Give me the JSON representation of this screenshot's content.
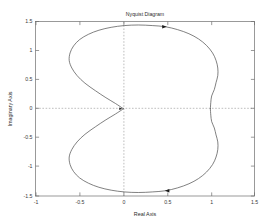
{
  "figure": {
    "title": "Nyquist Diagram",
    "xlabel": "Real Axis",
    "ylabel": "Imaginary Axis",
    "background": "#ffffff",
    "curve_color": "#4a4a4a",
    "grid_color": "#9a9a9a",
    "axis_color": "#6e6e6e"
  },
  "chart_data": {
    "type": "line",
    "title": "Nyquist Diagram",
    "xlabel": "Real Axis",
    "ylabel": "Imaginary Axis",
    "xlim": [
      -1,
      1.5
    ],
    "ylim": [
      -1.5,
      1.5
    ],
    "xticks": [
      -1,
      -0.5,
      0,
      0.5,
      1,
      1.5
    ],
    "xtick_labels": [
      "-1",
      "-0.5",
      "0",
      "0.5",
      "1",
      "1.5"
    ],
    "yticks": [
      -1.5,
      -1,
      -0.5,
      0,
      0.5,
      1,
      1.5
    ],
    "ytick_labels": [
      "-1.5",
      "-1",
      "-0.5",
      "0",
      "0.5",
      "1",
      "1.5"
    ],
    "grid": false,
    "zero_lines": true,
    "legend": null,
    "series": [
      {
        "name": "Nyquist contour (upper branch, increasing frequency)",
        "direction": "clockwise-from-origin-over-top-to-right",
        "points": [
          [
            0.0,
            0.0
          ],
          [
            -0.09,
            0.09
          ],
          [
            -0.2,
            0.19
          ],
          [
            -0.32,
            0.31
          ],
          [
            -0.44,
            0.44
          ],
          [
            -0.53,
            0.57
          ],
          [
            -0.59,
            0.7
          ],
          [
            -0.62,
            0.83
          ],
          [
            -0.61,
            0.96
          ],
          [
            -0.57,
            1.08
          ],
          [
            -0.5,
            1.19
          ],
          [
            -0.4,
            1.28
          ],
          [
            -0.28,
            1.35
          ],
          [
            -0.14,
            1.4
          ],
          [
            0.01,
            1.43
          ],
          [
            0.17,
            1.44
          ],
          [
            0.33,
            1.43
          ],
          [
            0.48,
            1.41
          ],
          [
            0.62,
            1.36
          ],
          [
            0.75,
            1.29
          ],
          [
            0.86,
            1.2
          ],
          [
            0.95,
            1.09
          ],
          [
            1.02,
            0.96
          ],
          [
            1.06,
            0.83
          ],
          [
            1.08,
            0.7
          ],
          [
            1.08,
            0.57
          ],
          [
            1.06,
            0.45
          ],
          [
            1.04,
            0.33
          ],
          [
            1.01,
            0.22
          ],
          [
            1.0,
            0.11
          ],
          [
            0.995,
            0.0
          ]
        ]
      },
      {
        "name": "Nyquist contour (lower branch, mirror image)",
        "direction": "right-under-bottom-back-to-origin",
        "points": [
          [
            0.995,
            0.0
          ],
          [
            1.0,
            -0.11
          ],
          [
            1.01,
            -0.22
          ],
          [
            1.04,
            -0.33
          ],
          [
            1.06,
            -0.45
          ],
          [
            1.08,
            -0.57
          ],
          [
            1.08,
            -0.7
          ],
          [
            1.06,
            -0.83
          ],
          [
            1.02,
            -0.96
          ],
          [
            0.95,
            -1.09
          ],
          [
            0.86,
            -1.2
          ],
          [
            0.75,
            -1.29
          ],
          [
            0.62,
            -1.36
          ],
          [
            0.48,
            -1.41
          ],
          [
            0.33,
            -1.43
          ],
          [
            0.17,
            -1.44
          ],
          [
            0.01,
            -1.43
          ],
          [
            -0.14,
            -1.4
          ],
          [
            -0.28,
            -1.35
          ],
          [
            -0.4,
            -1.28
          ],
          [
            -0.5,
            -1.19
          ],
          [
            -0.57,
            -1.08
          ],
          [
            -0.61,
            -0.96
          ],
          [
            -0.62,
            -0.83
          ],
          [
            -0.59,
            -0.7
          ],
          [
            -0.53,
            -0.57
          ],
          [
            -0.44,
            -0.44
          ],
          [
            -0.32,
            -0.31
          ],
          [
            -0.2,
            -0.19
          ],
          [
            -0.09,
            -0.09
          ],
          [
            0.0,
            0.0
          ]
        ]
      }
    ],
    "annotations": [
      {
        "name": "direction-arrow-top",
        "x": 0.47,
        "y": 1.41,
        "angle_deg": 0,
        "label": "",
        "description": "rightward arrowhead on upper branch"
      },
      {
        "name": "direction-arrow-bottom",
        "x": 0.5,
        "y": -1.41,
        "angle_deg": 180,
        "label": "",
        "description": "leftward arrowhead on lower branch"
      },
      {
        "name": "direction-arrow-origin",
        "x": -0.03,
        "y": 0.0,
        "angle_deg": 0,
        "label": "",
        "description": "small rightward arrowhead at origin cusp"
      }
    ]
  }
}
